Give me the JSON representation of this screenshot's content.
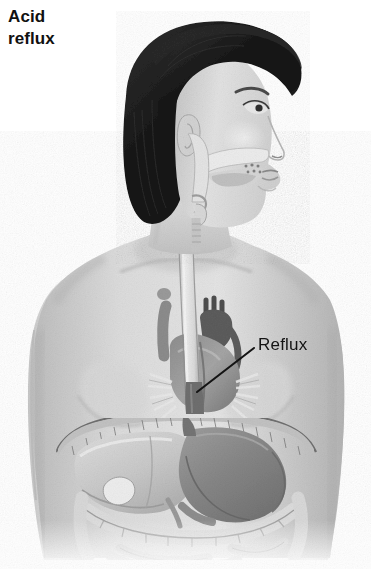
{
  "figure": {
    "title_line_1": "Acid",
    "title_line_2": "reflux",
    "view": "right lateral / anterior cutaway",
    "style": "grayscale medical illustration",
    "background_color": "#ffffff"
  },
  "callouts": [
    {
      "id": "reflux",
      "label": "Reflux",
      "text_x": 258,
      "text_y": 335,
      "leader_from_x": 254,
      "leader_from_y": 348,
      "leader_to_x": 197,
      "leader_to_y": 392,
      "points_at": "gastroesophageal junction / lower esophageal sphincter",
      "color": "#141414"
    }
  ],
  "palette": {
    "hair_dark": "#1d1d1d",
    "hair_mid": "#3a3a3a",
    "skin_light": "#e2e2e2",
    "skin_mid": "#cfcfcf",
    "skin_shadow": "#a9a9a9",
    "organ_light": "#d6d6d6",
    "organ_mid": "#a8a8a8",
    "stomach_dark": "#8a8a8a",
    "vessel_dark": "#5a5a5a",
    "outline": "#4a4a4a",
    "text": "#141414",
    "background": "#ffffff"
  },
  "anatomy_labels": {
    "head": "head-profile",
    "hair": "bob-haircut",
    "face": "face-profile",
    "ear": "ear",
    "eye": "eye",
    "nose": "nose",
    "lips": "lips",
    "neck": "neck",
    "pharynx": "pharynx",
    "esophagus": "esophagus",
    "trachea": "trachea",
    "clavicle": "clavicle",
    "shoulder_left": "left-shoulder",
    "shoulder_right": "right-shoulder",
    "arm_left": "left-arm",
    "arm_right": "right-arm",
    "breast_left": "left-breast",
    "breast_right": "right-breast",
    "heart": "heart",
    "aorta": "aortic-arch",
    "diaphragm": "diaphragm",
    "liver": "liver",
    "gallbladder": "gallbladder",
    "stomach": "stomach",
    "les": "lower-esophageal-sphincter",
    "intestines": "intestines",
    "abdomen": "abdomen"
  }
}
